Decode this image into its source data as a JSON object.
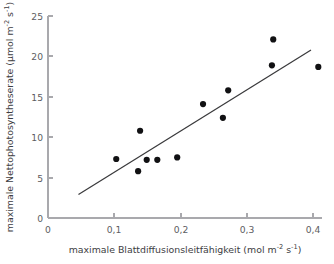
{
  "chart_data": {
    "type": "scatter",
    "title": "",
    "xlabel": "maximale Blattdiffusionsleitfähigkeit (mol m⁻² s⁻¹)",
    "ylabel": "maximale Nettophotosyntheserate (μmol m⁻² s⁻¹)",
    "xlabel_parts": {
      "main": "maximale Blattdiffusionsleitfähigkeit (mol m",
      "sup1": "-2",
      "mid": " s",
      "sup2": "-1",
      "tail": ")"
    },
    "ylabel_parts": {
      "main": "maximale Nettophotosyntheserate (μmol m",
      "sup1": "-2",
      "mid": " s",
      "sup2": "-1",
      "tail": ")"
    },
    "xlim": [
      0,
      0.42
    ],
    "ylim": [
      0,
      25
    ],
    "xticks": [
      0,
      0.1,
      0.2,
      0.3,
      0.4
    ],
    "yticks": [
      0,
      5,
      10,
      15,
      20,
      25
    ],
    "xtick_labels": [
      "0",
      "0,1",
      "0,2",
      "0,3",
      "0,4"
    ],
    "ytick_labels": [
      "0",
      "5",
      "10",
      "15",
      "20",
      "25"
    ],
    "grid": false,
    "legend": "none",
    "marker": "filled-circle",
    "marker_color": "#111113",
    "marker_radius": 3.1,
    "axis_color": "#a9a9ad",
    "line_color": "#3a3a3c",
    "x": [
      0.103,
      0.136,
      0.139,
      0.149,
      0.165,
      0.195,
      0.234,
      0.264,
      0.272,
      0.338,
      0.34,
      0.408
    ],
    "y": [
      7.3,
      5.8,
      10.8,
      7.2,
      7.2,
      7.5,
      14.1,
      12.4,
      15.8,
      18.9,
      22.1,
      18.7
    ],
    "points": [
      {
        "x": 0.103,
        "y": 7.3
      },
      {
        "x": 0.136,
        "y": 5.8
      },
      {
        "x": 0.139,
        "y": 10.8
      },
      {
        "x": 0.149,
        "y": 7.2
      },
      {
        "x": 0.165,
        "y": 7.2
      },
      {
        "x": 0.195,
        "y": 7.5
      },
      {
        "x": 0.234,
        "y": 14.1
      },
      {
        "x": 0.264,
        "y": 12.4
      },
      {
        "x": 0.272,
        "y": 15.8
      },
      {
        "x": 0.338,
        "y": 18.9
      },
      {
        "x": 0.34,
        "y": 22.1
      },
      {
        "x": 0.408,
        "y": 18.7
      }
    ],
    "trendline": {
      "type": "linear-fit",
      "x_start": 0.046,
      "y_start": 2.9,
      "x_end": 0.397,
      "y_end": 20.8
    }
  }
}
